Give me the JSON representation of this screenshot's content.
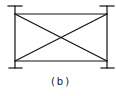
{
  "figure": {
    "caption": "(b)",
    "stroke_color": "#111111",
    "background": "#ffffff"
  }
}
